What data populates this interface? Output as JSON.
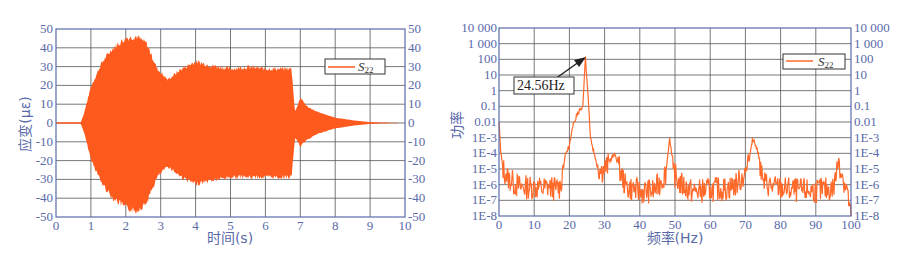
{
  "chart_data": [
    {
      "type": "line",
      "title": "",
      "xlabel": "时间(s)",
      "ylabel": "应变(με)",
      "xlim": [
        0,
        10
      ],
      "ylim": [
        -50,
        50
      ],
      "x_ticks": [
        "0",
        "1",
        "2",
        "3",
        "4",
        "5",
        "6",
        "7",
        "8",
        "9",
        "10"
      ],
      "y_ticks": [
        "50",
        "40",
        "30",
        "20",
        "10",
        "0",
        "-10",
        "-20",
        "-30",
        "-40",
        "-50"
      ],
      "grid": true,
      "legend": {
        "entries": [
          "S22"
        ],
        "position": "upper right"
      },
      "series": [
        {
          "name": "S22",
          "color": "#ff5a1e",
          "description": "Dense oscillating strain signal; envelope amplitude vs time",
          "envelope": {
            "x": [
              0,
              0.7,
              0.8,
              1.0,
              1.3,
              1.6,
              2.0,
              2.3,
              2.6,
              2.9,
              3.2,
              3.6,
              4.0,
              4.4,
              5.0,
              5.5,
              6.0,
              6.5,
              6.75,
              6.85,
              7.0,
              7.2,
              7.5,
              8.0,
              8.5,
              9.0,
              9.5,
              10
            ],
            "upper": [
              0,
              0,
              5,
              20,
              33,
              41,
              47,
              48,
              44,
              30,
              24,
              30,
              34,
              32,
              30,
              31,
              30,
              30,
              30,
              6,
              14,
              9,
              6,
              3,
              1.5,
              0.5,
              0.2,
              0
            ],
            "lower": [
              0,
              0,
              -5,
              -20,
              -33,
              -41,
              -47,
              -49,
              -44,
              -30,
              -24,
              -30,
              -34,
              -32,
              -30,
              -30,
              -30,
              -30,
              -30,
              -8,
              -13,
              -9,
              -6,
              -3,
              -1.5,
              -0.5,
              -0.2,
              0
            ]
          }
        }
      ]
    },
    {
      "type": "line",
      "title": "",
      "xlabel": "频率(Hz)",
      "ylabel": "功率",
      "xlim": [
        0,
        100
      ],
      "ylim": [
        1e-08,
        10000
      ],
      "yscale": "log",
      "x_ticks": [
        "0",
        "10",
        "20",
        "30",
        "40",
        "50",
        "60",
        "70",
        "80",
        "90",
        "100"
      ],
      "y_ticks": [
        "10 000",
        "1 000",
        "100",
        "10",
        "1",
        "0.1",
        "0.01",
        "1E-3",
        "1E-4",
        "1E-5",
        "1E-6",
        "1E-7",
        "1E-8"
      ],
      "grid": true,
      "legend": {
        "entries": [
          "S22"
        ],
        "position": "upper right"
      },
      "annotations": [
        {
          "text": "24.56Hz",
          "x": 24.56,
          "y": 150
        }
      ],
      "series": [
        {
          "name": "S22",
          "color": "#ff6a2a",
          "x": [
            0,
            0.5,
            1,
            2,
            4,
            6,
            8,
            10,
            12,
            14,
            16,
            17.5,
            18,
            19,
            20,
            21,
            22,
            23,
            23.8,
            24.56,
            25.3,
            26,
            27,
            28,
            29,
            30,
            32,
            33,
            34,
            36,
            38,
            40,
            44,
            46,
            47.5,
            48.5,
            49.5,
            51,
            55,
            60,
            65,
            68,
            70,
            71,
            72,
            73,
            74,
            75,
            78,
            85,
            90,
            95,
            96.5,
            97.5,
            99,
            100
          ],
          "y": [
            0.01,
            0.0001,
            2e-05,
            5e-06,
            2e-06,
            1e-06,
            1e-06,
            1e-06,
            8e-07,
            1e-06,
            8e-07,
            1e-06,
            1e-05,
            0.0001,
            0.0003,
            0.005,
            0.03,
            0.06,
            0.1,
            150,
            0.5,
            0.001,
            0.0001,
            2e-05,
            1e-05,
            1.5e-05,
            5e-05,
            8e-05,
            2e-05,
            1e-06,
            8e-07,
            5e-07,
            6e-07,
            2e-06,
            1e-05,
            0.001,
            1e-05,
            2e-06,
            5e-07,
            7e-07,
            8e-07,
            2e-06,
            8e-06,
            3e-05,
            0.001,
            0.0003,
            5e-05,
            2e-06,
            1e-06,
            6e-07,
            6e-07,
            8e-07,
            5e-05,
            5e-06,
            5e-07,
            1e-08
          ]
        }
      ]
    }
  ],
  "left_chart": {
    "ylabel": "应变(με)",
    "xlabel": "时间(s)",
    "legend_label": "S",
    "legend_sub": "22"
  },
  "right_chart": {
    "ylabel": "功率",
    "xlabel": "频率(Hz)",
    "legend_label": "S",
    "legend_sub": "22",
    "annotation": "24.56Hz"
  },
  "colors": {
    "axis": "#5a6aa8",
    "grid": "#555555",
    "series": "#ff5a1e"
  }
}
